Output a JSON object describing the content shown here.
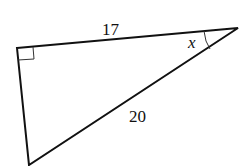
{
  "diagram": {
    "type": "right-triangle",
    "vertices": {
      "right_angle": [
        17,
        48
      ],
      "angle_x": [
        238,
        28
      ],
      "bottom": [
        29,
        165
      ]
    },
    "labels": {
      "top_side": "17",
      "hypotenuse": "20",
      "angle": "x"
    },
    "right_angle_marker": true,
    "stroke_color": "#111111"
  }
}
